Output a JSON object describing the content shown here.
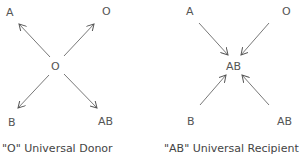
{
  "left": {
    "center": "O",
    "top_left": "A",
    "top_right": "O",
    "bottom_left": "B",
    "bottom_right": "AB",
    "caption": "\"O\" Universal Donor",
    "arrow_direction": "outward"
  },
  "right": {
    "center": "AB",
    "top_left": "A",
    "top_right": "O",
    "bottom_left": "B",
    "bottom_right": "AB",
    "caption": "\"AB\" Universal Recipient",
    "arrow_direction": "inward"
  },
  "colors": {
    "line": "#555555",
    "text": "#555555"
  }
}
